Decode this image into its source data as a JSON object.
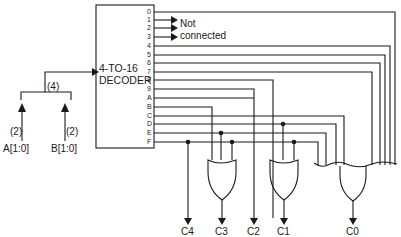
{
  "diagram": {
    "decoder": {
      "title_line1": "4-TO-16",
      "title_line2": "DECODER",
      "outputs": [
        "0",
        "1",
        "2",
        "3",
        "4",
        "5",
        "6",
        "7",
        "8",
        "9",
        "A",
        "B",
        "C",
        "D",
        "E",
        "F"
      ]
    },
    "not_connected": {
      "line1": "Not",
      "line2": "connected"
    },
    "inputs": {
      "bus_width_combined": "(4)",
      "a": {
        "width": "(2)",
        "label": "A[1:0]"
      },
      "b": {
        "width": "(2)",
        "label": "B[1:0]"
      }
    },
    "outputs_bottom": [
      "C4",
      "C3",
      "C2",
      "C1",
      "C0"
    ],
    "colors": {
      "line": "#1a1a1a",
      "background": "#ffffff"
    }
  }
}
